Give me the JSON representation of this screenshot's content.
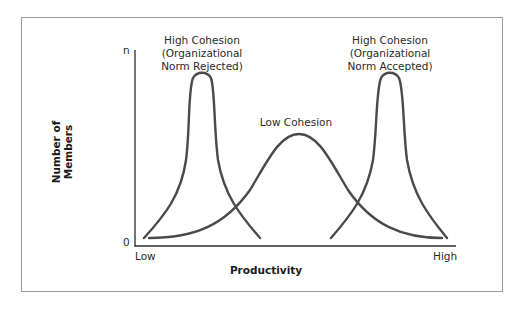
{
  "diagram": {
    "y_axis": {
      "label_line1": "Number of",
      "label_line2": "Members",
      "top_tick": "n",
      "bottom_tick": "0"
    },
    "x_axis": {
      "label": "Productivity",
      "left_tick": "Low",
      "right_tick": "High"
    },
    "curves": [
      {
        "id": "high-cohesion-rejected",
        "label_line1": "High Cohesion",
        "label_line2": "(Organizational",
        "label_line3": "Norm Rejected)"
      },
      {
        "id": "low-cohesion",
        "label_line1": "Low Cohesion"
      },
      {
        "id": "high-cohesion-accepted",
        "label_line1": "High Cohesion",
        "label_line2": "(Organizational",
        "label_line3": "Norm Accepted)"
      }
    ],
    "colors": {
      "curve": "#4a4a4a",
      "axis": "#2a2a2a",
      "frame": "#9a9a9a"
    }
  }
}
